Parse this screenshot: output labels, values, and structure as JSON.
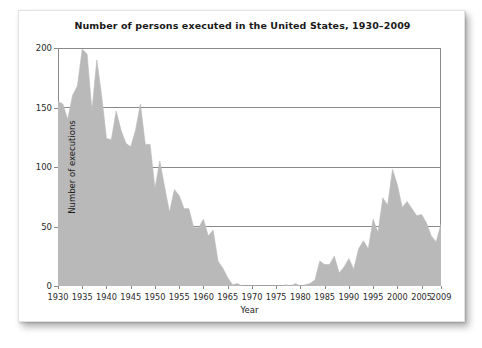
{
  "figure": {
    "title": "Number of persons executed in the United States, 1930–2009",
    "background_color": "#ffffff",
    "card_color": "#ffffff"
  },
  "chart_data": {
    "type": "area",
    "title": "Number of persons executed in the United States, 1930–2009",
    "xlabel": "Year",
    "ylabel": "Number of executions",
    "xlim": [
      1930,
      2009
    ],
    "ylim": [
      0,
      200
    ],
    "grid": "horizontal",
    "legend": null,
    "area_fill_color": "#b9b9b9",
    "axis_color": "#8a8a8a",
    "gridline_color": "#8a8a8a",
    "y_ticks": [
      0,
      50,
      100,
      150,
      200
    ],
    "x_ticks": [
      1930,
      1935,
      1940,
      1945,
      1950,
      1955,
      1960,
      1965,
      1970,
      1975,
      1980,
      1985,
      1990,
      1995,
      2000,
      2005,
      2009
    ],
    "x": [
      1930,
      1931,
      1932,
      1933,
      1934,
      1935,
      1936,
      1937,
      1938,
      1939,
      1940,
      1941,
      1942,
      1943,
      1944,
      1945,
      1946,
      1947,
      1948,
      1949,
      1950,
      1951,
      1952,
      1953,
      1954,
      1955,
      1956,
      1957,
      1958,
      1959,
      1960,
      1961,
      1962,
      1963,
      1964,
      1965,
      1966,
      1967,
      1968,
      1969,
      1970,
      1971,
      1972,
      1973,
      1974,
      1975,
      1976,
      1977,
      1978,
      1979,
      1980,
      1981,
      1982,
      1983,
      1984,
      1985,
      1986,
      1987,
      1988,
      1989,
      1990,
      1991,
      1992,
      1993,
      1994,
      1995,
      1996,
      1997,
      1998,
      1999,
      2000,
      2001,
      2002,
      2003,
      2004,
      2005,
      2006,
      2007,
      2008,
      2009
    ],
    "values": [
      155,
      153,
      140,
      160,
      168,
      199,
      195,
      147,
      190,
      160,
      124,
      123,
      147,
      131,
      120,
      117,
      131,
      153,
      119,
      119,
      82,
      105,
      83,
      62,
      81,
      76,
      65,
      65,
      49,
      49,
      56,
      42,
      47,
      21,
      15,
      7,
      1,
      2,
      0,
      0,
      0,
      0,
      0,
      0,
      0,
      0,
      0,
      1,
      0,
      2,
      0,
      1,
      2,
      5,
      21,
      18,
      18,
      25,
      11,
      16,
      23,
      14,
      31,
      38,
      31,
      56,
      45,
      74,
      68,
      98,
      85,
      66,
      71,
      65,
      59,
      60,
      53,
      42,
      37,
      52
    ],
    "series_name": "Executions"
  },
  "axes": {
    "y_tick_labels": [
      "0",
      "50",
      "100",
      "150",
      "200"
    ],
    "x_tick_labels": [
      "1930",
      "1935",
      "1940",
      "1945",
      "1950",
      "1955",
      "1960",
      "1965",
      "1970",
      "1975",
      "1980",
      "1985",
      "1990",
      "1995",
      "2000",
      "2005",
      "2009"
    ],
    "y_title": "Number of executions",
    "x_title": "Year"
  }
}
